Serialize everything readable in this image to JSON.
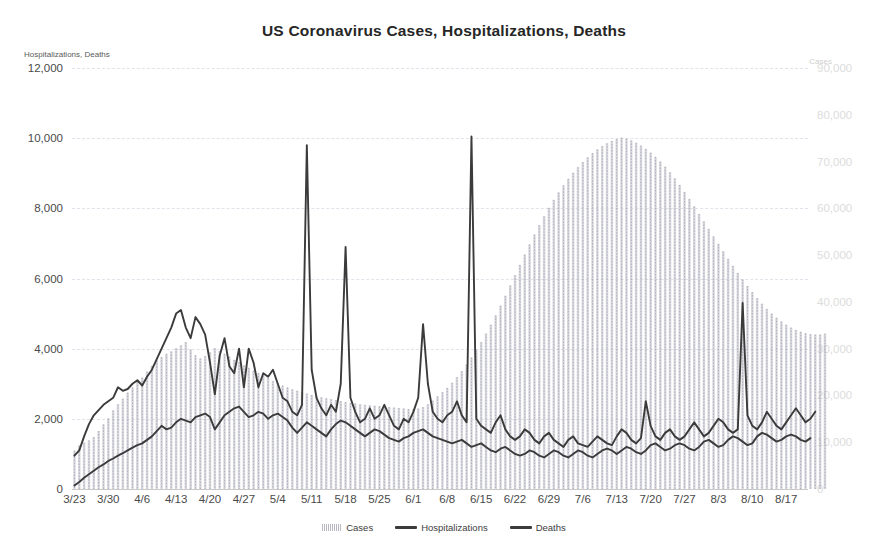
{
  "chart_data": {
    "type": "bar",
    "title": "US Coronavirus  Cases,  Hospitalizations,  Deaths",
    "xlabel": "",
    "ylabel": "Hospitalizations, Deaths",
    "y2label": "Cases",
    "ylim": [
      0,
      12000
    ],
    "y2lim": [
      0,
      90000
    ],
    "grid": true,
    "legend_position": "bottom",
    "yticks": [
      "0",
      "2,000",
      "4,000",
      "6,000",
      "8,000",
      "10,000",
      "12,000"
    ],
    "ytick_values": [
      0,
      2000,
      4000,
      6000,
      8000,
      10000,
      12000
    ],
    "y2ticks": [
      "0",
      "10,000",
      "20,000",
      "30,000",
      "40,000",
      "50,000",
      "60,000",
      "70,000",
      "80,000",
      "90,000"
    ],
    "y2tick_values": [
      0,
      10000,
      20000,
      30000,
      40000,
      50000,
      60000,
      70000,
      80000,
      90000
    ],
    "xticks": [
      "3/23",
      "3/30",
      "4/6",
      "4/13",
      "4/20",
      "4/27",
      "5/4",
      "5/11",
      "5/18",
      "5/25",
      "6/1",
      "6/8",
      "6/15",
      "6/22",
      "6/29",
      "7/6",
      "7/13",
      "7/20",
      "7/27",
      "8/3",
      "8/10",
      "8/17"
    ],
    "xtick_indices": [
      0,
      7,
      14,
      21,
      28,
      35,
      42,
      49,
      56,
      63,
      70,
      77,
      84,
      91,
      98,
      105,
      112,
      119,
      126,
      133,
      140,
      147
    ],
    "x_start": "3/23",
    "x_end": "8/21",
    "n_points": 152,
    "series": [
      {
        "name": "Cases",
        "axis": "right",
        "render": "bar",
        "color": "#b9b9c4",
        "values": [
          8200,
          9300,
          9900,
          10400,
          11100,
          12400,
          13800,
          15100,
          16800,
          18100,
          19300,
          20600,
          21700,
          22900,
          23800,
          25100,
          26300,
          27500,
          28200,
          28900,
          29400,
          30100,
          30700,
          31400,
          29800,
          28600,
          27900,
          28400,
          29200,
          30100,
          29500,
          28900,
          28300,
          27600,
          27100,
          26400,
          25900,
          25300,
          24800,
          24200,
          23700,
          23100,
          22600,
          22100,
          21700,
          21300,
          21000,
          20700,
          20400,
          20100,
          19900,
          19600,
          19400,
          19200,
          19000,
          18800,
          18600,
          18400,
          18300,
          18100,
          18000,
          17900,
          17800,
          17700,
          17600,
          17500,
          17400,
          17300,
          17200,
          17100,
          17000,
          17200,
          17500,
          18100,
          18900,
          19800,
          20700,
          21600,
          22700,
          23900,
          25200,
          26600,
          28100,
          29700,
          31400,
          33200,
          35100,
          37100,
          39200,
          41300,
          43500,
          45700,
          47900,
          50100,
          52300,
          54400,
          56400,
          58300,
          60100,
          61800,
          63400,
          64900,
          66300,
          67600,
          68800,
          69900,
          70900,
          71800,
          72600,
          73300,
          73900,
          74400,
          74800,
          75100,
          74900,
          74500,
          74000,
          73400,
          72700,
          71900,
          71000,
          70000,
          68900,
          67700,
          66400,
          65000,
          63500,
          62000,
          60400,
          58800,
          57200,
          55600,
          54000,
          52400,
          50800,
          49200,
          47700,
          46200,
          44800,
          43400,
          42100,
          40800,
          39600,
          38500,
          37500,
          36600,
          35800,
          35100,
          34500,
          34000,
          33600,
          33300,
          33100,
          33000,
          33000,
          33200
        ]
      },
      {
        "name": "Hospitalizations",
        "axis": "left",
        "render": "line",
        "color": "#3b3b3b",
        "values": [
          950,
          1100,
          1500,
          1850,
          2100,
          2250,
          2400,
          2500,
          2600,
          2900,
          2800,
          2850,
          3000,
          3100,
          2950,
          3200,
          3400,
          3700,
          4000,
          4300,
          4600,
          5000,
          5100,
          4600,
          4300,
          4900,
          4700,
          4400,
          3600,
          2700,
          3800,
          4300,
          3500,
          3300,
          4000,
          2900,
          4000,
          3600,
          2900,
          3300,
          3200,
          3400,
          3000,
          2600,
          2500,
          2200,
          2100,
          2400,
          9800,
          3400,
          2600,
          2300,
          2100,
          2400,
          2200,
          3000,
          6900,
          2600,
          2200,
          1900,
          2000,
          2300,
          2000,
          2100,
          2400,
          2100,
          1800,
          1700,
          2000,
          1900,
          2200,
          2600,
          4700,
          3000,
          2200,
          2000,
          1900,
          2100,
          2200,
          2500,
          2100,
          1900,
          10050,
          2000,
          1800,
          1700,
          1600,
          1900,
          2100,
          1700,
          1500,
          1400,
          1500,
          1700,
          1600,
          1400,
          1300,
          1500,
          1600,
          1400,
          1300,
          1200,
          1400,
          1500,
          1300,
          1250,
          1200,
          1350,
          1500,
          1400,
          1300,
          1250,
          1500,
          1700,
          1600,
          1400,
          1300,
          1450,
          2500,
          1800,
          1500,
          1400,
          1600,
          1700,
          1500,
          1400,
          1500,
          1700,
          1900,
          1700,
          1500,
          1600,
          1800,
          2000,
          1900,
          1700,
          1600,
          1700,
          5300,
          2100,
          1800,
          1700,
          1900,
          2200,
          2000,
          1800,
          1700,
          1900,
          2100,
          2300,
          2100,
          1900,
          2000,
          2200
        ]
      },
      {
        "name": "Deaths",
        "axis": "left",
        "render": "line",
        "color": "#3b3b3b",
        "values": [
          100,
          200,
          320,
          420,
          520,
          620,
          700,
          800,
          870,
          950,
          1020,
          1100,
          1180,
          1250,
          1300,
          1400,
          1500,
          1650,
          1800,
          1700,
          1750,
          1900,
          2000,
          1950,
          1900,
          2050,
          2100,
          2150,
          2050,
          1700,
          1900,
          2100,
          2200,
          2300,
          2350,
          2200,
          2050,
          2100,
          2200,
          2150,
          2000,
          2100,
          2150,
          2050,
          1950,
          1750,
          1600,
          1750,
          1900,
          1800,
          1700,
          1600,
          1500,
          1700,
          1850,
          1950,
          1900,
          1800,
          1700,
          1600,
          1500,
          1600,
          1700,
          1650,
          1550,
          1450,
          1400,
          1350,
          1450,
          1500,
          1600,
          1650,
          1700,
          1600,
          1500,
          1450,
          1400,
          1350,
          1300,
          1350,
          1400,
          1300,
          1200,
          1250,
          1300,
          1200,
          1100,
          1050,
          1150,
          1200,
          1100,
          1000,
          950,
          1000,
          1100,
          1050,
          950,
          900,
          1000,
          1100,
          1050,
          950,
          900,
          1000,
          1100,
          1050,
          950,
          900,
          1000,
          1100,
          1150,
          1100,
          1000,
          1100,
          1200,
          1150,
          1050,
          1000,
          1100,
          1250,
          1300,
          1200,
          1100,
          1150,
          1250,
          1300,
          1250,
          1150,
          1100,
          1200,
          1350,
          1400,
          1300,
          1200,
          1250,
          1400,
          1500,
          1450,
          1350,
          1250,
          1300,
          1500,
          1600,
          1550,
          1450,
          1350,
          1400,
          1500,
          1550,
          1500,
          1400,
          1350,
          1450
        ]
      }
    ]
  },
  "legend": {
    "items": [
      {
        "label": "Cases",
        "marker": "bars"
      },
      {
        "label": "Hospitalizations",
        "marker": "line"
      },
      {
        "label": "Deaths",
        "marker": "line"
      }
    ]
  }
}
